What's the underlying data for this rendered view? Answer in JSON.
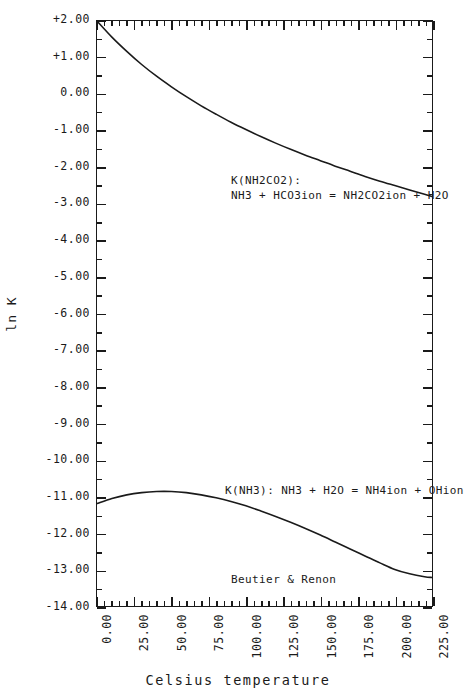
{
  "chart_data": {
    "type": "line",
    "title": "",
    "xlabel": "Celsius temperature",
    "ylabel": "ln K",
    "xlim": [
      0,
      225
    ],
    "ylim": [
      -14,
      2
    ],
    "grid": false,
    "legend": "none",
    "xticks": [
      "0.00",
      "25.00",
      "50.00",
      "75.00",
      "100.00",
      "125.00",
      "150.00",
      "175.00",
      "200.00",
      "225.00"
    ],
    "xtick_values": [
      0,
      25,
      50,
      75,
      100,
      125,
      150,
      175,
      200,
      225
    ],
    "xtick_minor_step": 5,
    "yticks": [
      "+2.00",
      "+1.00",
      "0.00",
      "-1.00",
      "-2.00",
      "-3.00",
      "-4.00",
      "-5.00",
      "-6.00",
      "-7.00",
      "-8.00",
      "-9.00",
      "-10.00",
      "-11.00",
      "-12.00",
      "-13.00",
      "-14.00"
    ],
    "ytick_values": [
      2,
      1,
      0,
      -1,
      -2,
      -3,
      -4,
      -5,
      -6,
      -7,
      -8,
      -9,
      -10,
      -11,
      -12,
      -13,
      -14
    ],
    "ytick_minor_step": 0.5,
    "series": [
      {
        "name": "K(NH2CO2)",
        "x": [
          0,
          10,
          20,
          30,
          40,
          50,
          60,
          70,
          80,
          90,
          100,
          110,
          120,
          130,
          140,
          150,
          160,
          170,
          180,
          190,
          200,
          210,
          220,
          225
        ],
        "values": [
          2.0,
          1.56,
          1.17,
          0.81,
          0.49,
          0.2,
          -0.07,
          -0.32,
          -0.55,
          -0.77,
          -0.97,
          -1.16,
          -1.34,
          -1.51,
          -1.67,
          -1.82,
          -1.97,
          -2.11,
          -2.25,
          -2.38,
          -2.5,
          -2.62,
          -2.74,
          -2.8
        ]
      },
      {
        "name": "K(NH3)",
        "x": [
          0,
          10,
          20,
          30,
          40,
          50,
          60,
          70,
          80,
          90,
          100,
          110,
          120,
          130,
          140,
          150,
          160,
          170,
          180,
          190,
          200,
          210,
          220,
          225
        ],
        "values": [
          -11.2,
          -11.06,
          -10.96,
          -10.9,
          -10.87,
          -10.87,
          -10.9,
          -10.96,
          -11.04,
          -11.14,
          -11.26,
          -11.4,
          -11.55,
          -11.71,
          -11.88,
          -12.06,
          -12.25,
          -12.44,
          -12.63,
          -12.82,
          -13.0,
          -13.12,
          -13.2,
          -13.22
        ]
      }
    ],
    "annotations": [
      {
        "name": "carbamate-reaction",
        "line1": "K(NH2CO2):",
        "line2": "NH3 + HCO3ion = NH2CO2ion + H2O"
      },
      {
        "name": "ammonia-reaction",
        "line1": "K(NH3): NH3 + H2O = NH4ion + OHion"
      },
      {
        "name": "source-citation",
        "line1": "Beutier & Renon"
      }
    ],
    "colors": {
      "ink": "#1a1a1a",
      "background": "#ffffff"
    }
  }
}
